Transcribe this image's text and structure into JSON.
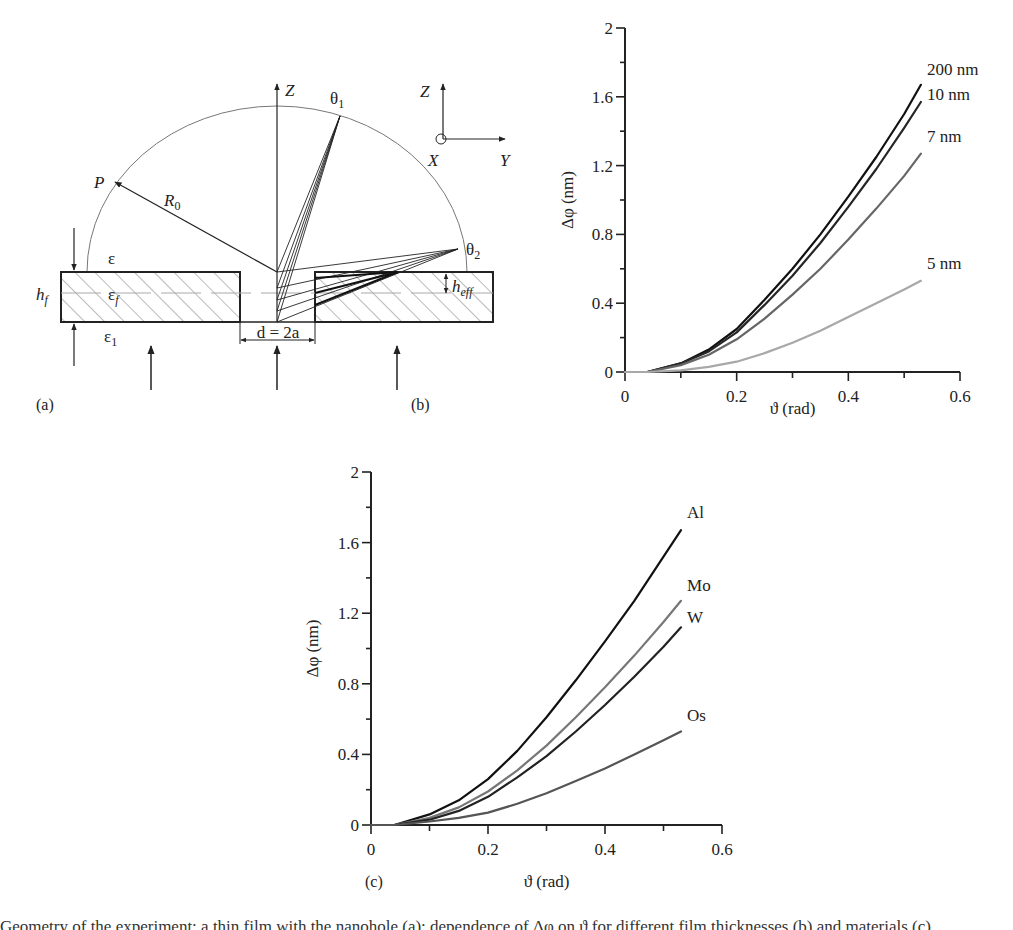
{
  "panel_a": {
    "label": "(a)",
    "labels": {
      "z_axis": "Z",
      "theta1": "θ",
      "theta1_sub": "1",
      "theta2": "θ",
      "theta2_sub": "2",
      "P": "P",
      "R0": "R",
      "R0_sub": "0",
      "eps": "ε",
      "eps_f": "ε",
      "eps_f_sub": "f",
      "eps_1": "ε",
      "eps_1_sub": "1",
      "h_f": "h",
      "h_f_sub": "f",
      "h_eff": "h",
      "h_eff_sub": "eff",
      "hole_width": "d = 2a",
      "coord_Z": "Z",
      "coord_X": "X",
      "coord_Y": "Y"
    }
  },
  "panel_b": {
    "label": "(b)"
  },
  "panel_c": {
    "label": "(c)"
  },
  "caption": "Geometry of the experiment: a thin film with the nanohole (a); dependence of Δφ on ϑ for different film thicknesses (b) and materials (c).",
  "chart_data": [
    {
      "id": "b",
      "type": "line",
      "title": "",
      "xlabel": "ϑ (rad)",
      "ylabel": "Δφ (nm)",
      "xlim": [
        0,
        0.6
      ],
      "ylim": [
        0,
        2
      ],
      "xticks": [
        0,
        0.2,
        0.4,
        0.6
      ],
      "xtick_labels": [
        "0",
        "0.2",
        "0.4",
        "0.6"
      ],
      "yticks": [
        0,
        0.4,
        0.8,
        1.2,
        1.6,
        2
      ],
      "ytick_labels": [
        "0",
        "0.4",
        "0.8",
        "1.2",
        "1.6",
        "2"
      ],
      "grid": false,
      "legend": "inline labels at curve ends",
      "x": [
        0,
        0.04,
        0.1,
        0.15,
        0.2,
        0.25,
        0.3,
        0.35,
        0.4,
        0.45,
        0.5,
        0.53
      ],
      "series": [
        {
          "name": "200 nm",
          "color": "#111111",
          "values": [
            0,
            0,
            0.05,
            0.13,
            0.25,
            0.42,
            0.6,
            0.8,
            1.02,
            1.25,
            1.5,
            1.67
          ]
        },
        {
          "name": "10 nm",
          "color": "#262626",
          "values": [
            0,
            0,
            0.05,
            0.12,
            0.23,
            0.39,
            0.56,
            0.75,
            0.96,
            1.18,
            1.42,
            1.57
          ]
        },
        {
          "name": "7 nm",
          "color": "#666666",
          "values": [
            0,
            0,
            0.04,
            0.1,
            0.19,
            0.31,
            0.45,
            0.6,
            0.77,
            0.95,
            1.14,
            1.27
          ]
        },
        {
          "name": "5 nm",
          "color": "#a8a8a8",
          "values": [
            0,
            0,
            0.01,
            0.03,
            0.06,
            0.11,
            0.17,
            0.24,
            0.32,
            0.4,
            0.48,
            0.53
          ]
        }
      ]
    },
    {
      "id": "c",
      "type": "line",
      "title": "",
      "xlabel": "ϑ (rad)",
      "ylabel": "Δφ (nm)",
      "xlim": [
        0,
        0.6
      ],
      "ylim": [
        0,
        2
      ],
      "xticks": [
        0,
        0.2,
        0.4,
        0.6
      ],
      "xtick_labels": [
        "0",
        "0.2",
        "0.4",
        "0.6"
      ],
      "yticks": [
        0,
        0.4,
        0.8,
        1.2,
        1.6,
        2
      ],
      "ytick_labels": [
        "0",
        "0.4",
        "0.8",
        "1.2",
        "1.6",
        "2"
      ],
      "grid": false,
      "legend": "inline labels at curve ends",
      "x": [
        0,
        0.04,
        0.1,
        0.15,
        0.2,
        0.25,
        0.3,
        0.35,
        0.4,
        0.45,
        0.5,
        0.53
      ],
      "series": [
        {
          "name": "Al",
          "color": "#111111",
          "values": [
            0,
            0,
            0.06,
            0.14,
            0.26,
            0.42,
            0.61,
            0.82,
            1.04,
            1.27,
            1.52,
            1.67
          ]
        },
        {
          "name": "Mo",
          "color": "#777777",
          "values": [
            0,
            0,
            0.04,
            0.1,
            0.19,
            0.31,
            0.45,
            0.61,
            0.78,
            0.96,
            1.15,
            1.27
          ]
        },
        {
          "name": "W",
          "color": "#222222",
          "values": [
            0,
            0,
            0.03,
            0.08,
            0.16,
            0.27,
            0.39,
            0.53,
            0.68,
            0.84,
            1.01,
            1.12
          ]
        },
        {
          "name": "Os",
          "color": "#555555",
          "values": [
            0,
            0,
            0.02,
            0.04,
            0.07,
            0.12,
            0.18,
            0.25,
            0.32,
            0.4,
            0.48,
            0.53
          ]
        }
      ]
    }
  ]
}
